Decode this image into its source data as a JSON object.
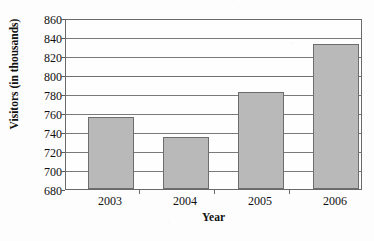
{
  "chart_data": {
    "type": "bar",
    "title": "Visitors to Sinclair's Historic Park, 2003 - 2006",
    "title_truncated": true,
    "categories": [
      "2003",
      "2004",
      "2005",
      "2006"
    ],
    "values": [
      757,
      735,
      783,
      834
    ],
    "xlabel": "Year",
    "ylabel": "Visitors (in thousands)",
    "ylim": [
      680,
      860
    ],
    "ytick_step": 20,
    "yticks": [
      "860",
      "840",
      "820",
      "800",
      "780",
      "760",
      "740",
      "720",
      "700",
      "680"
    ],
    "grid": true,
    "legend": "none",
    "bar_fill_color": "#b9b9b9",
    "bar_border_color": "#6d6d6d",
    "axis_color": "#6a6a6a",
    "background_color": "#fdfdfd"
  }
}
